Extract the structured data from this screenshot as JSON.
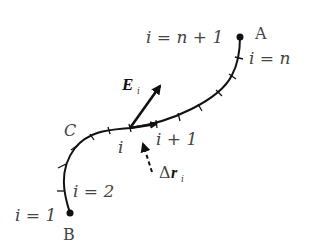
{
  "diagram": {
    "type": "line-integral-path",
    "endpoints": {
      "A": {
        "label": "A",
        "index_label": "i = n + 1"
      },
      "B": {
        "label": "B",
        "index_label": "i = 1"
      }
    },
    "curve_label": "C",
    "segment_labels": {
      "near_A": "i = n",
      "near_B": "i = 2",
      "current": "i",
      "next": "i + 1"
    },
    "vectors": {
      "field": {
        "label": "E",
        "subscript": "i"
      },
      "displacement": {
        "label_prefix": "Δ",
        "label": "r",
        "subscript": "i"
      }
    },
    "colors": {
      "curve": "#111111",
      "text": "#444444"
    }
  }
}
